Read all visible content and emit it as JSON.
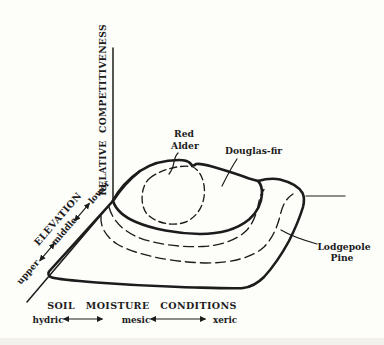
{
  "figure": {
    "background_color": "#fdfdfa",
    "ink_color": "#1c1c1c",
    "y_axis": {
      "label": "RELATIVE COMPETITIVENESS"
    },
    "elevation_axis": {
      "label": "ELEVATION",
      "ticks": [
        "upper",
        "middle",
        "lower"
      ]
    },
    "moisture_axis": {
      "label": "SOIL MOISTURE CONDITIONS",
      "ticks": [
        "hydric",
        "mesic",
        "xeric"
      ]
    },
    "species": [
      {
        "name": "Red Alder",
        "name_line1": "Red",
        "name_line2": "Alder",
        "line_style": "solid"
      },
      {
        "name": "Douglas-fir",
        "name_line1": "Douglas-fir",
        "name_line2": "",
        "line_style": "dashed"
      },
      {
        "name": "Lodgepole Pine",
        "name_line1": "Lodgepole",
        "name_line2": "Pine",
        "line_style": "solid"
      }
    ]
  }
}
